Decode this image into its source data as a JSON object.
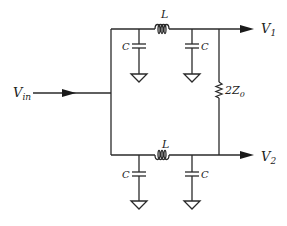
{
  "diagram": {
    "type": "circuit",
    "input": {
      "label": "V",
      "sub": "in"
    },
    "outputs": [
      {
        "label": "V",
        "sub": "1"
      },
      {
        "label": "V",
        "sub": "2"
      }
    ],
    "top_branch": {
      "inductor": "L",
      "cap_left": "C",
      "cap_right": "C"
    },
    "bottom_branch": {
      "inductor": "L",
      "cap_left": "C",
      "cap_right": "C"
    },
    "resistor": {
      "label": "2Z",
      "sub": "0"
    },
    "colors": {
      "line": "#2a2a2a",
      "background": "#ffffff"
    }
  }
}
